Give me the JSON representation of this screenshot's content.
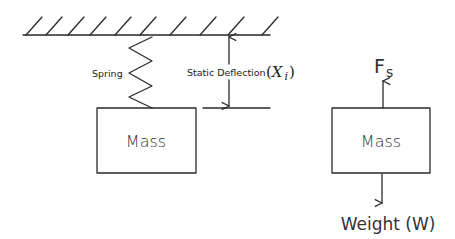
{
  "diagram": {
    "left": {
      "spring_label": "Spring",
      "deflection_label": "Static Deflection",
      "deflection_symbol_open": "(",
      "deflection_symbol": "X",
      "deflection_subscript": "i",
      "deflection_symbol_close": ")",
      "mass_label": "Mass"
    },
    "right": {
      "force_symbol": "F",
      "force_subscript": "s",
      "mass_label": "Mass",
      "weight_label": "Weight (W)"
    },
    "colors": {
      "line": "#2a2a2a",
      "background": "#ffffff"
    }
  }
}
